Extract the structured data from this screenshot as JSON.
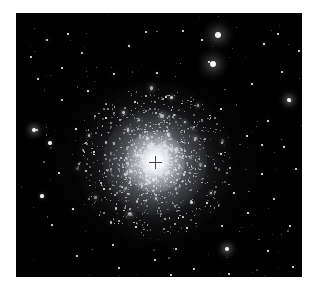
{
  "image": {
    "kind": "astronomical-photograph",
    "subject": "globular star cluster",
    "description": "Monochrome telescope exposure of a dense globular star cluster on a black sky field, surrounded by scattered foreground field stars, printed with a white border.",
    "caption": "",
    "orientation": "landscape",
    "width_px": 317,
    "height_px": 294
  },
  "frame": {
    "border_color": "#fefefe",
    "border_left_px": 16,
    "border_top_px": 13,
    "border_right_px": 15,
    "border_bottom_px": 17
  },
  "sky": {
    "background_color": "#010101",
    "plate_left_px": 16,
    "plate_top_px": 13,
    "plate_width_px": 286,
    "plate_height_px": 264
  },
  "cluster": {
    "label": "globular cluster",
    "center_x_px": 155,
    "center_y_px": 162,
    "core_radius_px": 15,
    "halo_radius_px": 78,
    "core_color": "#ffffff",
    "halo_color": "#c4c8d2",
    "resolved_member_count": 1600
  },
  "center_marker": {
    "label": "centre fiducial cross",
    "x_px": 152,
    "y_px": 162,
    "size_px": 13,
    "color": "#121214"
  },
  "field_stars": {
    "label": "foreground field stars",
    "count": 96,
    "color": "#ffffff",
    "notable": [
      {
        "name": "bright-star-upper-right-a",
        "x_px": 218,
        "y_px": 35,
        "size_px": 6
      },
      {
        "name": "bright-star-upper-right-b",
        "x_px": 213,
        "y_px": 64,
        "size_px": 6
      },
      {
        "name": "bright-star-far-right",
        "x_px": 289,
        "y_px": 100,
        "size_px": 4
      },
      {
        "name": "bright-star-left-mid",
        "x_px": 34,
        "y_px": 130,
        "size_px": 4
      },
      {
        "name": "triple-star-lower-right",
        "x_px": 227,
        "y_px": 249,
        "size_px": 4
      }
    ]
  },
  "chart_data": null
}
